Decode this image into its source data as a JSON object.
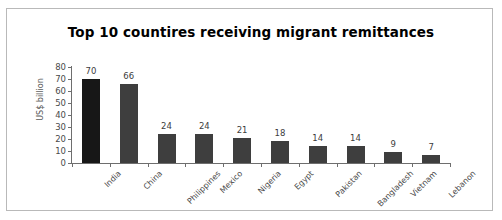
{
  "chart_data": {
    "type": "bar",
    "title": "Top 10 countires receiving migrant remittances",
    "xlabel": "",
    "ylabel": "US$ billion",
    "ylim": [
      0,
      80
    ],
    "yticks": [
      0,
      10,
      20,
      30,
      40,
      50,
      60,
      70,
      80
    ],
    "grid": false,
    "legend": false,
    "categories": [
      "India",
      "China",
      "Philippines",
      "Mexico",
      "Nigeria",
      "Egypt",
      "Pakistan",
      "Bangladesh",
      "Vietnam",
      "Lebanon"
    ],
    "values": [
      70,
      66,
      24,
      24,
      21,
      18,
      14,
      14,
      9,
      7
    ],
    "value_labels": [
      "70",
      "66",
      "24",
      "24",
      "21",
      "18",
      "14",
      "14",
      "9",
      "7"
    ],
    "bar_colors": [
      "#171717",
      "#3e3e3e",
      "#3e3e3e",
      "#3e3e3e",
      "#3e3e3e",
      "#3e3e3e",
      "#3e3e3e",
      "#3e3e3e",
      "#3e3e3e",
      "#3e3e3e"
    ],
    "axis_color": "#6e6e6e",
    "text_color": "#4a4a4a",
    "title_color": "#000000",
    "background": "#ffffff",
    "frame_color": "#b9b9b9"
  }
}
